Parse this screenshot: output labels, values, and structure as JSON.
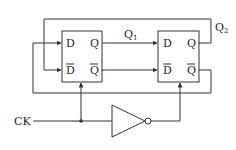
{
  "diagram": {
    "type": "circuit-schematic",
    "flip_flops": [
      {
        "id": "ff1",
        "inputs": [
          "D",
          "D̄"
        ],
        "outputs": [
          "Q",
          "Q̄"
        ]
      },
      {
        "id": "ff2",
        "inputs": [
          "D",
          "D̄"
        ],
        "outputs": [
          "Q",
          "Q̄"
        ]
      }
    ],
    "labels": {
      "ff1_d": "D",
      "ff1_dbar": "D",
      "ff1_q": "Q",
      "ff1_qbar": "Q",
      "ff2_d": "D",
      "ff2_dbar": "D",
      "ff2_q": "Q",
      "ff2_qbar": "Q",
      "q1": "Q",
      "q1_sub": "1",
      "q2": "Q",
      "q2_sub": "2",
      "clock": "CK"
    },
    "connections": [
      "FF1.Q -> FF2.D (Q1)",
      "FF1.Q̄ -> FF2.D̄",
      "FF2.Q (Q2) -> FF1.D̄ (top feedback)",
      "FF2.Q̄ -> FF1.D (bottom feedback)",
      "CK -> FF1.clock",
      "CK -> inverter -> FF2.clock"
    ],
    "colors": {
      "line": "#333333",
      "text": "#222222",
      "background": "#ffffff"
    }
  }
}
